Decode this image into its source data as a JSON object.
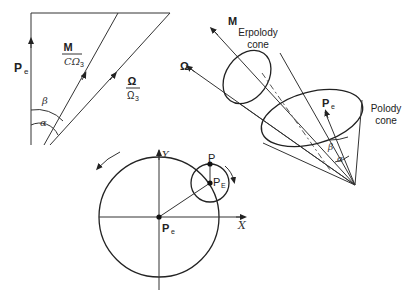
{
  "left_diagram": {
    "pe_label": "P",
    "pe_sub": "e",
    "m_num": "M",
    "m_den": "CΩ",
    "m_den_sub": "3",
    "omega_num": "Ω",
    "omega_den": "Ω",
    "omega_den_sub": "3",
    "beta": "β",
    "alpha": "α"
  },
  "cone_diagram": {
    "m_label": "M",
    "omega_label": "Ω",
    "erpolody_line1": "Erpolody",
    "erpolody_line2": "cone",
    "polody_line1": "Polody",
    "polody_line2": "cone",
    "pe_label": "P",
    "pe_sub": "e",
    "beta": "β",
    "alpha": "α"
  },
  "circle_diagram": {
    "y_axis": "Y",
    "x_axis": "X",
    "p_label": "P",
    "pe_center_label": "P",
    "pe_center_sub": "e",
    "pE_label": "P",
    "pE_sub": "E"
  }
}
